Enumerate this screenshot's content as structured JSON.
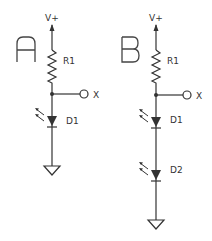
{
  "circuits": [
    {
      "id": "A",
      "title": "A",
      "supply_label": "V+",
      "resistor_label": "R1",
      "output_label": "X",
      "leds": [
        {
          "label": "D1"
        }
      ],
      "ground": true
    },
    {
      "id": "B",
      "title": "B",
      "supply_label": "V+",
      "resistor_label": "R1",
      "output_label": "X",
      "leds": [
        {
          "label": "D1"
        },
        {
          "label": "D2"
        }
      ],
      "ground": true
    }
  ],
  "colors": {
    "line": "#333333",
    "background": "#ffffff"
  }
}
